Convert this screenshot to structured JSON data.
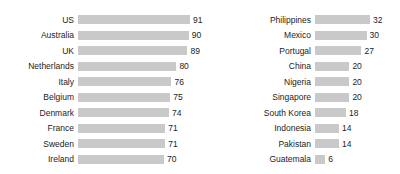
{
  "chart_data": [
    {
      "type": "bar",
      "orientation": "horizontal",
      "panel": "left",
      "title": "",
      "xlabel": "",
      "ylabel": "",
      "grid": false,
      "legend": null,
      "xlim": [
        0,
        91
      ],
      "categories": [
        "US",
        "Australia",
        "UK",
        "Netherlands",
        "Italy",
        "Belgium",
        "Denmark",
        "France",
        "Sweden",
        "Ireland"
      ],
      "values": [
        91,
        90,
        89,
        80,
        76,
        75,
        74,
        71,
        71,
        70
      ],
      "bar_color": "#c9c9c9",
      "value_labels": [
        "91",
        "90",
        "89",
        "80",
        "76",
        "75",
        "74",
        "71",
        "71",
        "70"
      ]
    },
    {
      "type": "bar",
      "orientation": "horizontal",
      "panel": "right",
      "title": "",
      "xlabel": "",
      "ylabel": "",
      "grid": false,
      "legend": null,
      "xlim": [
        0,
        32
      ],
      "categories": [
        "Philippines",
        "Mexico",
        "Portugal",
        "China",
        "Nigeria",
        "Singapore",
        "South Korea",
        "Indonesia",
        "Pakistan",
        "Guatemala"
      ],
      "values": [
        32,
        30,
        27,
        20,
        20,
        20,
        18,
        14,
        14,
        6
      ],
      "bar_color": "#c9c9c9",
      "value_labels": [
        "32",
        "30",
        "27",
        "20",
        "20",
        "20",
        "18",
        "14",
        "14",
        "6"
      ]
    }
  ],
  "left_panel": {
    "rows": [
      {
        "label": "US",
        "value": "91"
      },
      {
        "label": "Australia",
        "value": "90"
      },
      {
        "label": "UK",
        "value": "89"
      },
      {
        "label": "Netherlands",
        "value": "80"
      },
      {
        "label": "Italy",
        "value": "76"
      },
      {
        "label": "Belgium",
        "value": "75"
      },
      {
        "label": "Denmark",
        "value": "74"
      },
      {
        "label": "France",
        "value": "71"
      },
      {
        "label": "Sweden",
        "value": "71"
      },
      {
        "label": "Ireland",
        "value": "70"
      }
    ]
  },
  "right_panel": {
    "rows": [
      {
        "label": "Philippines",
        "value": "32"
      },
      {
        "label": "Mexico",
        "value": "30"
      },
      {
        "label": "Portugal",
        "value": "27"
      },
      {
        "label": "China",
        "value": "20"
      },
      {
        "label": "Nigeria",
        "value": "20"
      },
      {
        "label": "Singapore",
        "value": "20"
      },
      {
        "label": "South Korea",
        "value": "18"
      },
      {
        "label": "Indonesia",
        "value": "14"
      },
      {
        "label": "Pakistan",
        "value": "14"
      },
      {
        "label": "Guatemala",
        "value": "6"
      }
    ]
  },
  "style": {
    "bar_color": "#c9c9c9",
    "background": "#ffffff",
    "text_color": "#1c1c1c"
  }
}
